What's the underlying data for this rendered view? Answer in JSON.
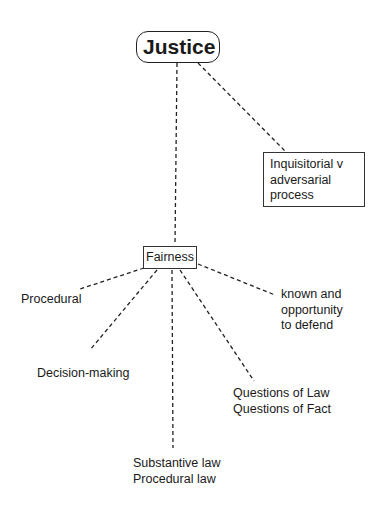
{
  "diagram": {
    "root": {
      "label": "Justice"
    },
    "nodes": {
      "inquisitorial": {
        "lines": [
          "Inquisitorial v",
          "adversarial",
          "process"
        ]
      },
      "fairness": {
        "label": "Fairness"
      },
      "procedural": {
        "label": "Procedural"
      },
      "decision_making": {
        "label": "Decision-making"
      },
      "known": {
        "lines": [
          "known and",
          "opportunity",
          "to defend"
        ]
      },
      "questions": {
        "lines": [
          "Questions of Law",
          "Questions of Fact"
        ]
      },
      "law": {
        "lines": [
          "Substantive law",
          "Procedural law"
        ]
      }
    },
    "edges": [
      {
        "from": "Justice",
        "to": "Fairness",
        "style": "dashed"
      },
      {
        "from": "Justice",
        "to": "Inquisitorial v adversarial process",
        "style": "dashed"
      },
      {
        "from": "Fairness",
        "to": "Procedural",
        "style": "dashed"
      },
      {
        "from": "Fairness",
        "to": "Decision-making",
        "style": "dashed"
      },
      {
        "from": "Fairness",
        "to": "Substantive law / Procedural law",
        "style": "dashed"
      },
      {
        "from": "Fairness",
        "to": "Questions of Law / Questions of Fact",
        "style": "dashed"
      },
      {
        "from": "Fairness",
        "to": "known and opportunity to defend",
        "style": "dashed"
      }
    ],
    "colors": {
      "line": "#222222",
      "text": "#1a1a1a",
      "background": "#ffffff"
    }
  }
}
